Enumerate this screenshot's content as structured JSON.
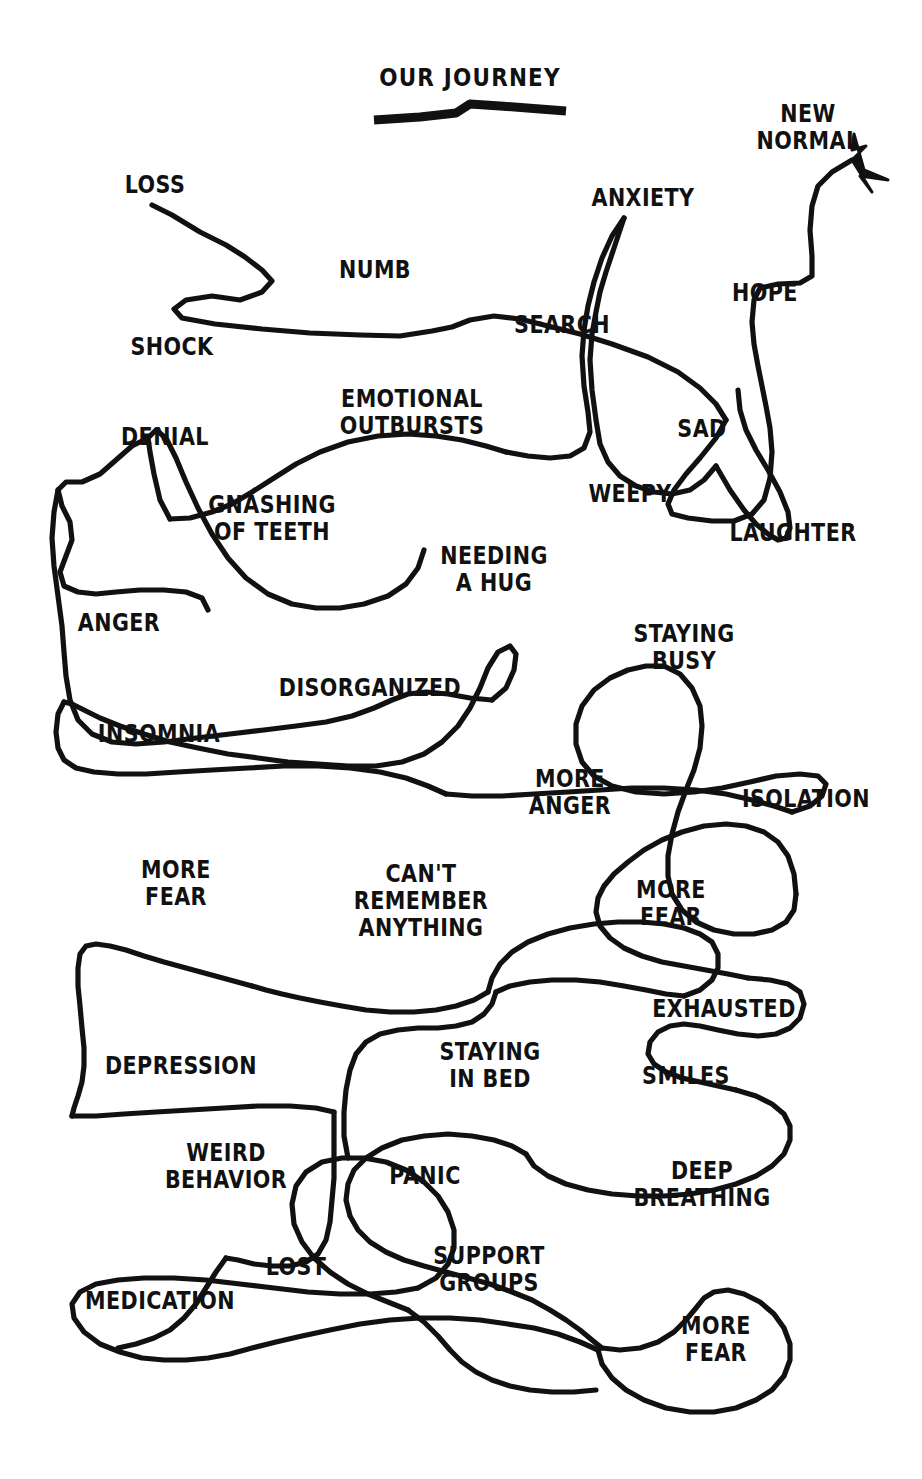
{
  "page": {
    "title": "OUR JOURNEY",
    "background_color": "#ffffff",
    "ink_color": "#111111",
    "width": 922,
    "height": 1479,
    "style": "hand-drawn single tangled line diagram"
  },
  "title_block": {
    "text": "OUR JOURNEY",
    "underline": "hand-drawn thick underline"
  },
  "endpoints": {
    "start_label": "LOSS",
    "end_label": "NEW NORMAL",
    "end_marker": "arrowhead pointing up-right"
  },
  "labels": [
    {
      "id": "loss",
      "text": "LOSS",
      "x": 155,
      "y": 185,
      "size": "t-big"
    },
    {
      "id": "numb",
      "text": "NUMB",
      "x": 375,
      "y": 270,
      "size": "t-big"
    },
    {
      "id": "anxiety",
      "text": "ANXIETY",
      "x": 643,
      "y": 198,
      "size": "t-big"
    },
    {
      "id": "new-normal",
      "text": "NEW\nNORMAL",
      "x": 808,
      "y": 128,
      "size": "t-big"
    },
    {
      "id": "shock",
      "text": "SHOCK",
      "x": 172,
      "y": 347,
      "size": "t-big"
    },
    {
      "id": "search",
      "text": "SEARCH",
      "x": 562,
      "y": 325,
      "size": "t-big"
    },
    {
      "id": "hope",
      "text": "HOPE",
      "x": 765,
      "y": 293,
      "size": "t-big"
    },
    {
      "id": "emotional-outbursts",
      "text": "EMOTIONAL\nOUTBURSTS",
      "x": 412,
      "y": 413,
      "size": "t-big"
    },
    {
      "id": "sad",
      "text": "SAD",
      "x": 702,
      "y": 429,
      "size": "t-big"
    },
    {
      "id": "denial",
      "text": "DENIAL",
      "x": 165,
      "y": 437,
      "size": "t-big"
    },
    {
      "id": "gnashing-of-teeth",
      "text": "GNASHING\nOF TEETH",
      "x": 272,
      "y": 519,
      "size": "t-big"
    },
    {
      "id": "weepy",
      "text": "WEEPY",
      "x": 630,
      "y": 494,
      "size": "t-big"
    },
    {
      "id": "laughter",
      "text": "LAUGHTER",
      "x": 793,
      "y": 533,
      "size": "t-big"
    },
    {
      "id": "needing-a-hug",
      "text": "NEEDING\nA HUG",
      "x": 494,
      "y": 570,
      "size": "t-big"
    },
    {
      "id": "anger",
      "text": "ANGER",
      "x": 119,
      "y": 623,
      "size": "t-big"
    },
    {
      "id": "staying-busy",
      "text": "STAYING\nBUSY",
      "x": 684,
      "y": 648,
      "size": "t-big"
    },
    {
      "id": "disorganized",
      "text": "DISORGANIZED",
      "x": 370,
      "y": 688,
      "size": "t-big"
    },
    {
      "id": "insomnia",
      "text": "INSOMNIA",
      "x": 159,
      "y": 734,
      "size": "t-big"
    },
    {
      "id": "more-anger",
      "text": "MORE\nANGER",
      "x": 570,
      "y": 793,
      "size": "t-big"
    },
    {
      "id": "isolation",
      "text": "ISOLATION",
      "x": 806,
      "y": 799,
      "size": "t-big"
    },
    {
      "id": "more-fear-left",
      "text": "MORE\nFEAR",
      "x": 176,
      "y": 884,
      "size": "t-big"
    },
    {
      "id": "cant-remember",
      "text": "CAN'T\nREMEMBER\nANYTHING",
      "x": 421,
      "y": 901,
      "size": "t-big"
    },
    {
      "id": "more-fear-right",
      "text": "MORE\nFEAR",
      "x": 671,
      "y": 904,
      "size": "t-big"
    },
    {
      "id": "exhausted",
      "text": "EXHAUSTED",
      "x": 724,
      "y": 1009,
      "size": "t-big"
    },
    {
      "id": "depression",
      "text": "DEPRESSION",
      "x": 181,
      "y": 1066,
      "size": "t-big"
    },
    {
      "id": "staying-in-bed",
      "text": "STAYING\nIN BED",
      "x": 490,
      "y": 1066,
      "size": "t-big"
    },
    {
      "id": "smiles",
      "text": "SMILES",
      "x": 686,
      "y": 1076,
      "size": "t-big"
    },
    {
      "id": "weird-behavior",
      "text": "WEIRD\nBEHAVIOR",
      "x": 226,
      "y": 1167,
      "size": "t-big"
    },
    {
      "id": "panic",
      "text": "PANIC",
      "x": 425,
      "y": 1176,
      "size": "t-big"
    },
    {
      "id": "deep-breathing",
      "text": "DEEP\nBREATHING",
      "x": 702,
      "y": 1185,
      "size": "t-big"
    },
    {
      "id": "lost",
      "text": "LOST",
      "x": 296,
      "y": 1267,
      "size": "t-big"
    },
    {
      "id": "support-groups",
      "text": "SUPPORT\nGROUPS",
      "x": 489,
      "y": 1270,
      "size": "t-big"
    },
    {
      "id": "medication",
      "text": "MEDICATION",
      "x": 160,
      "y": 1301,
      "size": "t-big"
    },
    {
      "id": "more-fear-bottom",
      "text": "MORE\nFEAR",
      "x": 716,
      "y": 1340,
      "size": "t-big"
    }
  ]
}
